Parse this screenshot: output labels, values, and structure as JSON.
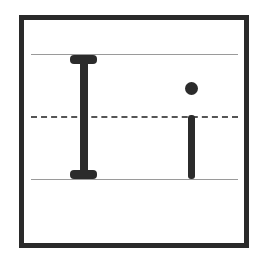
{
  "worksheet": {
    "title": "Letter Ii handwriting practice",
    "letters": {
      "uppercase": "I",
      "lowercase": "i"
    },
    "guides": {
      "top_line": "solid",
      "mid_line": "dashed",
      "base_line": "solid"
    },
    "colors": {
      "border": "#2a2a2a",
      "glyph": "#2b2b2b",
      "guide_solid": "#9a9a9a",
      "guide_dashed": "#555555",
      "background": "#ffffff"
    }
  }
}
